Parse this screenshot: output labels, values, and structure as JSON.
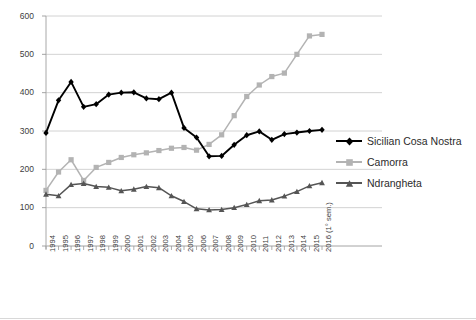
{
  "chart_data": {
    "type": "line",
    "title": "",
    "subtitle": "",
    "xlabel": "",
    "ylabel": "",
    "ylim": [
      0,
      600
    ],
    "ytick_values": [
      0,
      100,
      200,
      300,
      400,
      500,
      600
    ],
    "ytick_labels": [
      "0",
      "100",
      "200",
      "300",
      "400",
      "500",
      "600"
    ],
    "grid": "horizontal",
    "legend_position": "right",
    "categories": [
      "1994",
      "1995",
      "1996",
      "1997",
      "1998",
      "1999",
      "2000",
      "2001",
      "2002",
      "2003",
      "2004",
      "2005",
      "2006",
      "2007",
      "2008",
      "2009",
      "2010",
      "2011",
      "2012",
      "2013",
      "2014",
      "2015",
      "2016 (1° sem.)"
    ],
    "series": [
      {
        "name": "Sicilian Cosa Nostra",
        "color": "#000000",
        "marker": "diamond",
        "values": [
          295,
          380,
          428,
          363,
          370,
          395,
          400,
          401,
          385,
          383,
          400,
          308,
          283,
          234,
          235,
          264,
          289,
          299,
          277,
          292,
          296,
          300,
          303
        ]
      },
      {
        "name": "Camorra",
        "color": "#b3b3b3",
        "marker": "square",
        "values": [
          145,
          193,
          225,
          171,
          205,
          218,
          231,
          238,
          243,
          249,
          255,
          257,
          250,
          265,
          290,
          340,
          390,
          420,
          442,
          451,
          500,
          548,
          552
        ]
      },
      {
        "name": "Ndrangheta",
        "color": "#555555",
        "marker": "triangle",
        "values": [
          135,
          131,
          160,
          163,
          155,
          153,
          144,
          148,
          155,
          152,
          131,
          116,
          97,
          94,
          95,
          100,
          108,
          118,
          120,
          130,
          142,
          157,
          165
        ]
      }
    ]
  },
  "legend": {
    "items": [
      {
        "label": "Sicilian Cosa Nostra"
      },
      {
        "label": "Camorra"
      },
      {
        "label": "Ndrangheta"
      }
    ]
  }
}
